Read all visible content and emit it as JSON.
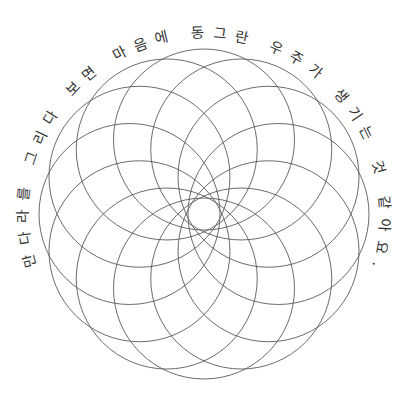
{
  "caption": {
    "text": "만다라를 그리다 보면 마음에 동그란 우주가 생기는 것 같아요.",
    "color": "#333333"
  },
  "mandala": {
    "center": [
      204,
      214
    ],
    "circle_count": 12,
    "circle_radius": 90.5,
    "orbit_radius": 74.5,
    "stroke_color": "#5a5a5a",
    "background": "#ffffff"
  },
  "text_path": {
    "radius": 176,
    "start_angle_deg": -107,
    "end_angle_deg": 107
  }
}
